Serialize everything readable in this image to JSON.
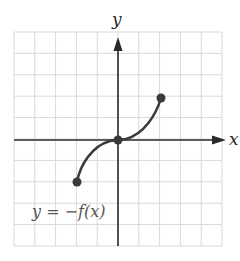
{
  "graph": {
    "x_axis_label": "x",
    "y_axis_label": "y",
    "equation_label": "y = −f(x)",
    "grid": {
      "xmin": -5,
      "xmax": 5,
      "ymin": -5,
      "ymax": 5,
      "step": 1
    },
    "colors": {
      "grid": "#d9d9d9",
      "axis": "#2a2a2a",
      "curve": "#3a3a3a",
      "points": "#3a3a3a"
    }
  },
  "chart_data": {
    "type": "line",
    "title": "",
    "equation": "y = -f(x)",
    "xlabel": "x",
    "ylabel": "y",
    "xlim": [
      -5,
      5
    ],
    "ylim": [
      -5,
      5
    ],
    "grid": true,
    "series": [
      {
        "name": "y = -f(x)",
        "points": [
          [
            -2,
            -2
          ],
          [
            -1.5,
            -0.9
          ],
          [
            -1,
            -0.3
          ],
          [
            -0.5,
            -0.05
          ],
          [
            0,
            0
          ],
          [
            0.5,
            0.05
          ],
          [
            1,
            0.3
          ],
          [
            1.5,
            0.9
          ],
          [
            2,
            2
          ]
        ],
        "marked_points": [
          [
            -2,
            -2
          ],
          [
            0,
            0
          ],
          [
            2,
            2
          ]
        ]
      }
    ]
  }
}
